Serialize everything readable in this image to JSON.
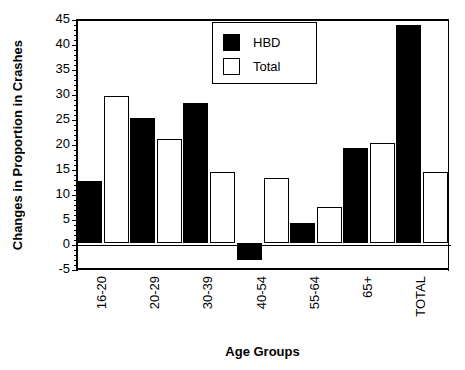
{
  "chart_data": {
    "type": "bar",
    "title": "",
    "xlabel": "Age Groups",
    "ylabel": "Changes in Proportion in Crashes",
    "categories": [
      "16-20",
      "20-29",
      "30-39",
      "40-54",
      "55-64",
      "65+",
      "TOTAL"
    ],
    "series": [
      {
        "name": "HBD",
        "color": "#000000",
        "values": [
          12.5,
          25.0,
          28.0,
          -3.3,
          4.1,
          19.0,
          43.7
        ]
      },
      {
        "name": "Total",
        "color": "#ffffff",
        "values": [
          29.5,
          20.8,
          14.2,
          13.0,
          7.2,
          20.0,
          14.2
        ]
      }
    ],
    "ylim": [
      -5,
      45
    ],
    "yticks": [
      -5,
      0,
      5,
      10,
      15,
      20,
      25,
      30,
      35,
      40,
      45
    ],
    "ytick_labels": [
      "-5",
      "0",
      "5",
      "10",
      "15",
      "20",
      "25",
      "30",
      "35",
      "40",
      "45"
    ],
    "grid": false,
    "legend_position": "top-center"
  },
  "legend": {
    "entries": [
      {
        "label": "HBD"
      },
      {
        "label": "Total"
      }
    ]
  },
  "axes": {
    "y_title": "Changes in Proportion in Crashes",
    "x_title": "Age Groups"
  }
}
